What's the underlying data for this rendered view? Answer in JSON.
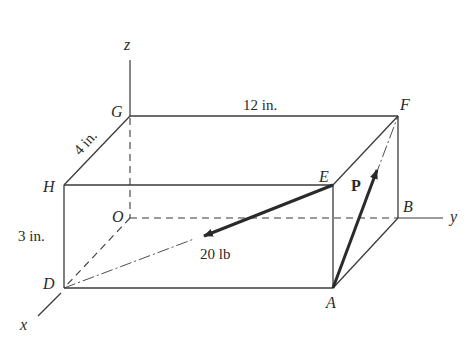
{
  "figure": {
    "type": "3D rectangular box with force vectors",
    "points": {
      "G": "G",
      "F": "F",
      "H": "H",
      "E": "E",
      "O": "O",
      "B": "B",
      "D": "D",
      "A": "A"
    },
    "axes": {
      "x": "x",
      "y": "y",
      "z": "z"
    },
    "dimensions": {
      "length": "12 in.",
      "depth": "4 in.",
      "height": "3 in."
    },
    "forces": {
      "force_EO": "20 lb",
      "force_P": "P"
    },
    "colors": {
      "line": "#3a3a3a",
      "text": "#2a2a2a",
      "background": "#ffffff"
    }
  }
}
